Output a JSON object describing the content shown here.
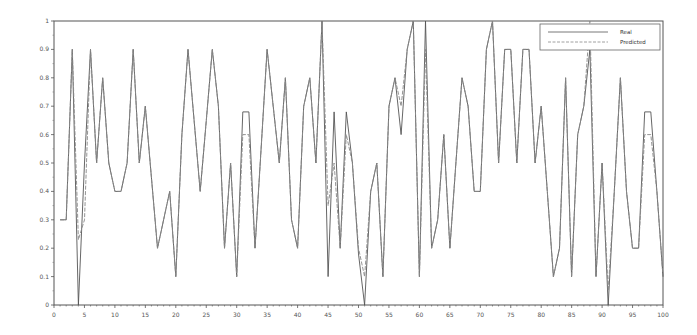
{
  "chart_data": {
    "type": "line",
    "title": "",
    "xlabel": "",
    "ylabel": "",
    "xlim": [
      0,
      100
    ],
    "ylim": [
      0,
      1
    ],
    "grid": false,
    "legend_position": "top-right",
    "x_ticks": [
      0,
      5,
      10,
      15,
      20,
      25,
      30,
      35,
      40,
      45,
      50,
      55,
      60,
      65,
      70,
      75,
      80,
      85,
      90,
      95,
      100
    ],
    "x_tick_labels": [
      "0",
      "5",
      "10",
      "15",
      "20",
      "25",
      "30",
      "35",
      "40",
      "45",
      "50",
      "55",
      "60",
      "65",
      "70",
      "75",
      "80",
      "85",
      "90",
      "95",
      "100"
    ],
    "y_ticks": [
      0,
      0.1,
      0.2,
      0.3,
      0.4,
      0.5,
      0.6,
      0.7,
      0.8,
      0.9,
      1
    ],
    "y_tick_labels": [
      "0",
      "0.1",
      "0.2",
      "0.3",
      "0.4",
      "0.5",
      "0.6",
      "0.7",
      "0.8",
      "0.9",
      "1"
    ],
    "x": [
      1,
      2,
      3,
      4,
      5,
      6,
      7,
      8,
      9,
      10,
      11,
      12,
      13,
      14,
      15,
      16,
      17,
      18,
      19,
      20,
      21,
      22,
      23,
      24,
      25,
      26,
      27,
      28,
      29,
      30,
      31,
      32,
      33,
      34,
      35,
      36,
      37,
      38,
      39,
      40,
      41,
      42,
      43,
      44,
      45,
      46,
      47,
      48,
      49,
      50,
      51,
      52,
      53,
      54,
      55,
      56,
      57,
      58,
      59,
      60,
      61,
      62,
      63,
      64,
      65,
      66,
      67,
      68,
      69,
      70,
      71,
      72,
      73,
      74,
      75,
      76,
      77,
      78,
      79,
      80,
      81,
      82,
      83,
      84,
      85,
      86,
      87,
      88,
      89,
      90,
      91,
      92,
      93,
      94,
      95,
      96,
      97,
      98,
      99,
      100
    ],
    "series": [
      {
        "name": "Real",
        "color": "#555555",
        "style": "solid",
        "values": [
          0.3,
          0.3,
          0.9,
          0.0,
          0.5,
          0.9,
          0.5,
          0.8,
          0.5,
          0.4,
          0.4,
          0.5,
          0.9,
          0.5,
          0.7,
          0.45,
          0.2,
          0.3,
          0.4,
          0.1,
          0.6,
          0.9,
          0.65,
          0.4,
          0.65,
          0.9,
          0.7,
          0.2,
          0.5,
          0.1,
          0.68,
          0.68,
          0.2,
          0.55,
          0.9,
          0.7,
          0.5,
          0.8,
          0.3,
          0.2,
          0.7,
          0.8,
          0.5,
          1.0,
          0.1,
          0.68,
          0.2,
          0.68,
          0.5,
          0.18,
          0.0,
          0.4,
          0.5,
          0.1,
          0.7,
          0.8,
          0.6,
          0.9,
          1.0,
          0.1,
          1.0,
          0.2,
          0.3,
          0.6,
          0.2,
          0.5,
          0.8,
          0.7,
          0.4,
          0.4,
          0.9,
          1.0,
          0.5,
          0.9,
          0.9,
          0.5,
          0.9,
          0.9,
          0.5,
          0.7,
          0.4,
          0.1,
          0.2,
          0.8,
          0.1,
          0.6,
          0.7,
          0.9,
          0.1,
          0.5,
          0.0,
          0.4,
          0.8,
          0.4,
          0.2,
          0.2,
          0.68,
          0.68,
          0.4,
          0.1
        ]
      },
      {
        "name": "Predicted",
        "color": "#888888",
        "style": "dashed",
        "values": [
          0.3,
          0.3,
          0.9,
          0.23,
          0.3,
          0.9,
          0.5,
          0.8,
          0.5,
          0.4,
          0.4,
          0.5,
          0.9,
          0.5,
          0.7,
          0.45,
          0.2,
          0.3,
          0.4,
          0.1,
          0.6,
          0.9,
          0.65,
          0.4,
          0.65,
          0.9,
          0.7,
          0.2,
          0.5,
          0.1,
          0.6,
          0.6,
          0.2,
          0.55,
          0.9,
          0.7,
          0.5,
          0.8,
          0.3,
          0.2,
          0.7,
          0.8,
          0.5,
          1.0,
          0.35,
          0.5,
          0.2,
          0.6,
          0.5,
          0.2,
          0.1,
          0.4,
          0.5,
          0.1,
          0.7,
          0.8,
          0.7,
          0.9,
          1.0,
          0.1,
          0.9,
          0.2,
          0.3,
          0.6,
          0.2,
          0.5,
          0.8,
          0.7,
          0.4,
          0.4,
          0.9,
          1.0,
          0.5,
          0.9,
          0.9,
          0.5,
          0.9,
          0.9,
          0.5,
          0.7,
          0.4,
          0.1,
          0.2,
          0.8,
          0.1,
          0.6,
          0.7,
          1.0,
          0.1,
          0.5,
          0.05,
          0.4,
          0.8,
          0.4,
          0.2,
          0.2,
          0.6,
          0.6,
          0.4,
          0.1
        ]
      }
    ],
    "legend": [
      {
        "label": "Real",
        "style": "solid"
      },
      {
        "label": "Predicted",
        "style": "dashed"
      }
    ]
  },
  "plot_area": {
    "left": 54,
    "top": 21,
    "right": 663,
    "bottom": 305
  },
  "colors": {
    "axis": "#444444",
    "background": "#ffffff"
  }
}
